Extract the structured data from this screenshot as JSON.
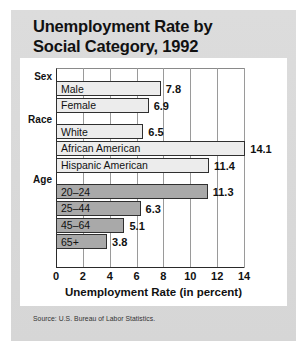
{
  "card": {
    "title_line1": "Unemployment Rate by",
    "title_line2": "Social Category, 1992",
    "source": "Source: U.S. Bureau of Labor Statistics."
  },
  "chart_data": {
    "type": "bar",
    "orientation": "horizontal",
    "title": "Unemployment Rate by Social Category, 1992",
    "xlabel": "Unemployment Rate (in percent)",
    "ylabel": "",
    "xlim": [
      0,
      14
    ],
    "xticks": [
      0,
      2,
      4,
      6,
      8,
      10,
      12,
      14
    ],
    "xtick_labels": [
      "0",
      "2",
      "4",
      "6",
      "8",
      "10",
      "12",
      "14"
    ],
    "grid": true,
    "legend": "none",
    "groups": [
      {
        "name": "Sex",
        "shade": "light",
        "bars": [
          {
            "label": "Male",
            "value": 7.8,
            "value_label": "7.8"
          },
          {
            "label": "Female",
            "value": 6.9,
            "value_label": "6.9"
          }
        ]
      },
      {
        "name": "Race",
        "shade": "light",
        "bars": [
          {
            "label": "White",
            "value": 6.5,
            "value_label": "6.5"
          },
          {
            "label": "African American",
            "value": 14.1,
            "value_label": "14.1"
          },
          {
            "label": "Hispanic American",
            "value": 11.4,
            "value_label": "11.4"
          }
        ]
      },
      {
        "name": "Age",
        "shade": "dark",
        "bars": [
          {
            "label": "20–24",
            "value": 11.3,
            "value_label": "11.3"
          },
          {
            "label": "25–44",
            "value": 6.3,
            "value_label": "6.3"
          },
          {
            "label": "45–64",
            "value": 5.1,
            "value_label": "5.1"
          },
          {
            "label": "65+",
            "value": 3.8,
            "value_label": "3.8"
          }
        ]
      }
    ],
    "categories": [
      "Male",
      "Female",
      "White",
      "African American",
      "Hispanic American",
      "20–24",
      "25–44",
      "45–64",
      "65+"
    ],
    "values": [
      7.8,
      6.9,
      6.5,
      14.1,
      11.4,
      11.3,
      6.3,
      5.1,
      3.8
    ],
    "colors": {
      "light_bar": "#ececec",
      "dark_bar": "#a9a9a9",
      "bar_border": "#2f2f2f",
      "card_bg": "#d9d9d9",
      "panel_bg": "#ffffff"
    }
  }
}
